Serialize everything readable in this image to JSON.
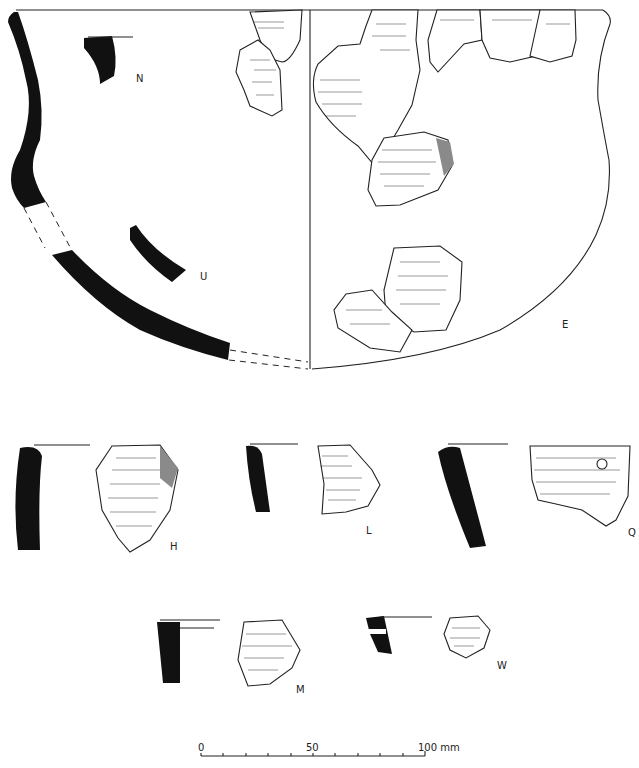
{
  "figure": {
    "type": "archaeological pottery drawing",
    "vessel_labels": {
      "N": "N",
      "U": "U",
      "E": "E",
      "H": "H",
      "L": "L",
      "Q": "Q",
      "M": "M",
      "W": "W"
    },
    "scale_bar": {
      "tick_0": "0",
      "tick_50": "50",
      "tick_100": "100 mm",
      "ticks": 10
    },
    "colors": {
      "section_fill": "#111111",
      "outline": "#222222",
      "background": "#ffffff"
    }
  }
}
